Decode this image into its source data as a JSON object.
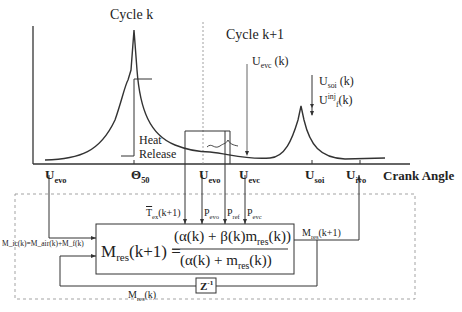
{
  "title_cycle_k": "Cycle k",
  "title_cycle_k1": "Cycle k+1",
  "heat_release": [
    "Heat",
    "Release"
  ],
  "axis_label": "Crank Angle",
  "axis_ticks": [
    {
      "main": "U",
      "sub": "evo"
    },
    {
      "main": "Θ",
      "sub": "50"
    },
    {
      "main": "U",
      "sub": "evo"
    },
    {
      "main": "U",
      "sub": "evc"
    },
    {
      "main": "U",
      "sub": "soi"
    },
    {
      "main": "U",
      "sub": "ivo"
    }
  ],
  "annotations": {
    "uevc_k": {
      "main": "U",
      "sub": "evc",
      "tail": " (k)"
    },
    "usoi_k": {
      "main": "U",
      "sub": "soi",
      "tail": " (k)"
    },
    "uinj_k": {
      "main": "U",
      "sup": "inj",
      "sub": "f",
      "tail": "(k)"
    }
  },
  "inputs": {
    "t_ex": {
      "main": "T",
      "sub": "ex",
      "tail": "(k+1)"
    },
    "p_evo": {
      "main": "P",
      "sub": "evo"
    },
    "p_ref": {
      "main": "P",
      "sub": "ref"
    },
    "p_evc": {
      "main": "P",
      "sub": "evc"
    },
    "m_ic": "M_ic(k)=M_air(k)+M_f(k)"
  },
  "equation": {
    "lhs_main": "M",
    "lhs_sub": "res",
    "lhs_tail": "(k+1) =",
    "numerator": "(α(k) + β(k)m",
    "numerator_sub": "res",
    "numerator_tail": "(k))",
    "denominator": "(α(k) + m",
    "denominator_sub": "res",
    "denominator_tail": "(k))"
  },
  "outputs": {
    "m_res_k1": {
      "main": "M",
      "sub": "res",
      "tail": "(k+1)"
    },
    "m_res_k": {
      "main": "M",
      "sub": "res",
      "tail": "(k)"
    }
  },
  "delay_block": "Z",
  "delay_sup": "-1"
}
